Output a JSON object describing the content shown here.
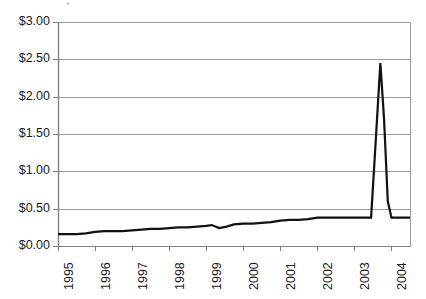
{
  "chart_data": {
    "type": "line",
    "title": "",
    "subtitle": "",
    "xlabel": "",
    "ylabel": "",
    "ylim": [
      0,
      3
    ],
    "xlim": [
      1995,
      2004.5
    ],
    "y_tick_values": [
      0,
      0.5,
      1.0,
      1.5,
      2.0,
      2.5,
      3.0
    ],
    "y_tick_labels": [
      "$0.00",
      "$0.50",
      "$1.00",
      "$1.50",
      "$2.00",
      "$2.50",
      "$3.00"
    ],
    "x_tick_values": [
      1995,
      1996,
      1997,
      1998,
      1999,
      2000,
      2001,
      2002,
      2003,
      2004
    ],
    "x_tick_labels": [
      "1995",
      "1996",
      "1997",
      "1998",
      "1999",
      "2000",
      "2001",
      "2002",
      "2003",
      "2004"
    ],
    "grid": "horizontal",
    "legend": "none",
    "value_prefix": "$",
    "series": [
      {
        "name": "price",
        "color": "#111111",
        "x": [
          1995.0,
          1995.25,
          1995.5,
          1995.75,
          1996.0,
          1996.25,
          1996.5,
          1996.75,
          1997.0,
          1997.25,
          1997.5,
          1997.75,
          1998.0,
          1998.25,
          1998.5,
          1998.75,
          1999.0,
          1999.15,
          1999.35,
          1999.55,
          1999.75,
          2000.0,
          2000.25,
          2000.5,
          2000.75,
          2001.0,
          2001.25,
          2001.5,
          2001.75,
          2002.0,
          2002.25,
          2002.5,
          2002.75,
          2003.0,
          2003.25,
          2003.45,
          2003.55,
          2003.7,
          2003.8,
          2003.9,
          2004.0,
          2004.25,
          2004.5
        ],
        "values": [
          0.16,
          0.16,
          0.16,
          0.17,
          0.19,
          0.2,
          0.2,
          0.2,
          0.21,
          0.22,
          0.23,
          0.23,
          0.24,
          0.25,
          0.25,
          0.26,
          0.27,
          0.28,
          0.24,
          0.26,
          0.29,
          0.3,
          0.3,
          0.31,
          0.32,
          0.34,
          0.35,
          0.35,
          0.36,
          0.38,
          0.38,
          0.38,
          0.38,
          0.38,
          0.38,
          0.38,
          1.2,
          2.45,
          1.7,
          0.6,
          0.38,
          0.38,
          0.38
        ]
      }
    ],
    "annotations": [
      {
        "label": "peak",
        "x": 2003.7,
        "y": 2.45
      }
    ]
  },
  "geometry": {
    "plot_left": 58,
    "plot_right": 410,
    "plot_top": 22,
    "plot_bottom": 246,
    "axis_color": "#808080",
    "grid_color": "#9a9a9a",
    "line_color": "#111111",
    "line_width": 2.2,
    "tick_length": 5,
    "x_tick_spacing": 38
  }
}
